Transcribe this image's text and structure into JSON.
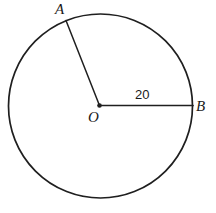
{
  "figure": {
    "kind": "circle-with-two-radii",
    "canvas": {
      "width": 216,
      "height": 213,
      "background": "#ffffff"
    },
    "stroke_color": "#1f1f1f",
    "circle": {
      "center_x": 100.5,
      "center_y": 106,
      "radius": 92,
      "stroke_width": 1.7,
      "fill": "none"
    },
    "center_point": {
      "label": "O",
      "x": 99.5,
      "y": 105.5,
      "dot_radius": 2.3
    },
    "points": [
      {
        "label": "A",
        "x": 66,
        "y": 20.5
      },
      {
        "label": "B",
        "x": 193,
        "y": 105.5
      }
    ],
    "segments": [
      {
        "name": "radius-OA",
        "from_label": "O",
        "to_label": "A",
        "x1": 99.5,
        "y1": 105.5,
        "x2": 66,
        "y2": 20.5,
        "stroke_width": 1.5
      },
      {
        "name": "radius-OB",
        "from_label": "O",
        "to_label": "B",
        "x1": 99.5,
        "y1": 105.5,
        "x2": 193,
        "y2": 105.5,
        "stroke_width": 1.7
      }
    ],
    "labels": {
      "point_a": "A",
      "point_b": "B",
      "center_o": "O",
      "radius_measure": "20"
    }
  }
}
